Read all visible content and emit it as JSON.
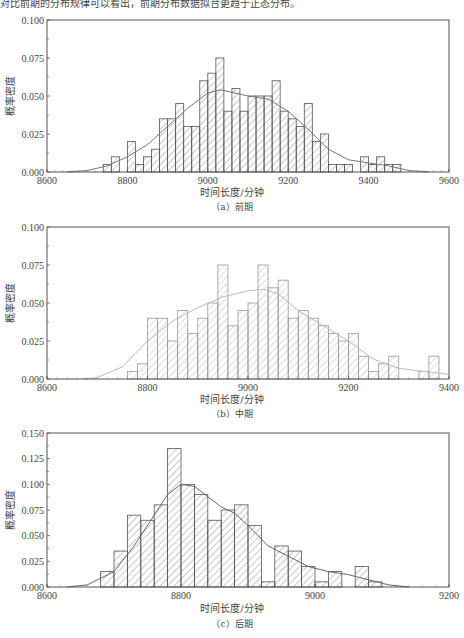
{
  "header_fragment": "对比前期的分布规律可以看出，前期分布数据拟合更趋于正态分布。",
  "chart_data": [
    {
      "id": "a",
      "type": "bar",
      "title": "",
      "caption": "（a）前期",
      "xlabel": "时间长度/分钟",
      "ylabel": "概率密度",
      "xlim": [
        8600,
        9600
      ],
      "ylim": [
        0,
        0.1
      ],
      "xticks": [
        8600,
        8800,
        9000,
        9200,
        9400,
        9600
      ],
      "yticks": [
        "0.000",
        "0.025",
        "0.050",
        "0.075",
        "0.100"
      ],
      "bin_width": 20,
      "bins_start": [
        8740,
        8760,
        8800,
        8820,
        8840,
        8860,
        8880,
        8900,
        8920,
        8940,
        8960,
        8980,
        9000,
        9020,
        9040,
        9060,
        9080,
        9100,
        9120,
        9140,
        9160,
        9180,
        9200,
        9220,
        9240,
        9260,
        9280,
        9300,
        9320,
        9340,
        9380,
        9400,
        9420,
        9440,
        9460
      ],
      "values": [
        0.005,
        0.01,
        0.02,
        0.005,
        0.01,
        0.015,
        0.035,
        0.035,
        0.045,
        0.03,
        0.03,
        0.06,
        0.065,
        0.075,
        0.04,
        0.055,
        0.04,
        0.05,
        0.05,
        0.05,
        0.06,
        0.04,
        0.035,
        0.03,
        0.045,
        0.02,
        0.025,
        0.005,
        0.005,
        0.005,
        0.01,
        0.005,
        0.01,
        0.005,
        0.005
      ],
      "curve": {
        "type": "kde",
        "x": [
          8650,
          8700,
          8750,
          8800,
          8850,
          8900,
          8950,
          9000,
          9030,
          9050,
          9100,
          9150,
          9200,
          9250,
          9300,
          9350,
          9400,
          9450,
          9500,
          9550
        ],
        "y": [
          0.0,
          0.001,
          0.004,
          0.01,
          0.018,
          0.03,
          0.042,
          0.052,
          0.054,
          0.053,
          0.05,
          0.048,
          0.04,
          0.028,
          0.015,
          0.008,
          0.006,
          0.004,
          0.001,
          0.0
        ]
      },
      "grid": false
    },
    {
      "id": "b",
      "type": "bar",
      "title": "",
      "caption": "（b）中期",
      "xlabel": "时间长度/分钟",
      "ylabel": "概率密度",
      "xlim": [
        8600,
        9400
      ],
      "ylim": [
        0,
        0.1
      ],
      "xticks": [
        8600,
        8800,
        9000,
        9200,
        9400
      ],
      "yticks": [
        "0.000",
        "0.025",
        "0.050",
        "0.075",
        "0.100"
      ],
      "bin_width": 20,
      "bins_start": [
        8760,
        8780,
        8800,
        8820,
        8840,
        8860,
        8880,
        8900,
        8920,
        8940,
        8960,
        8980,
        9000,
        9020,
        9040,
        9060,
        9080,
        9100,
        9120,
        9140,
        9160,
        9180,
        9200,
        9220,
        9240,
        9260,
        9280,
        9340,
        9360
      ],
      "values": [
        0.005,
        0.01,
        0.04,
        0.04,
        0.025,
        0.045,
        0.03,
        0.04,
        0.05,
        0.075,
        0.035,
        0.045,
        0.05,
        0.075,
        0.06,
        0.065,
        0.04,
        0.045,
        0.04,
        0.035,
        0.03,
        0.025,
        0.03,
        0.015,
        0.005,
        0.01,
        0.015,
        0.005,
        0.015
      ],
      "curve": {
        "type": "kde",
        "x": [
          8670,
          8700,
          8750,
          8800,
          8850,
          8900,
          8950,
          9000,
          9030,
          9060,
          9100,
          9150,
          9200,
          9250,
          9300,
          9350,
          9400
        ],
        "y": [
          0.0,
          0.001,
          0.008,
          0.025,
          0.038,
          0.047,
          0.054,
          0.058,
          0.059,
          0.056,
          0.045,
          0.035,
          0.025,
          0.013,
          0.007,
          0.005,
          0.003
        ]
      },
      "grid": false
    },
    {
      "id": "c",
      "type": "bar",
      "title": "",
      "caption": "（c）后期",
      "xlabel": "时间长度/分钟",
      "ylabel": "概率密度",
      "xlim": [
        8600,
        9200
      ],
      "ylim": [
        0,
        0.15
      ],
      "xticks": [
        8600,
        8800,
        9000,
        9200
      ],
      "yticks": [
        "0.000",
        "0.025",
        "0.050",
        "0.075",
        "0.100",
        "0.125",
        "0.150"
      ],
      "bin_width": 20,
      "bins_start": [
        8680,
        8700,
        8720,
        8740,
        8760,
        8780,
        8800,
        8820,
        8840,
        8860,
        8880,
        8900,
        8920,
        8940,
        8960,
        8980,
        9000,
        9020,
        9060,
        9080
      ],
      "values": [
        0.015,
        0.035,
        0.07,
        0.065,
        0.08,
        0.135,
        0.1,
        0.09,
        0.065,
        0.075,
        0.08,
        0.06,
        0.005,
        0.04,
        0.035,
        0.02,
        0.005,
        0.015,
        0.02,
        0.005
      ],
      "curve": {
        "type": "kde",
        "x": [
          8630,
          8660,
          8700,
          8730,
          8760,
          8780,
          8800,
          8820,
          8840,
          8860,
          8880,
          8900,
          8930,
          8960,
          8990,
          9020,
          9050,
          9080,
          9110,
          9140
        ],
        "y": [
          0.0,
          0.002,
          0.015,
          0.04,
          0.07,
          0.09,
          0.1,
          0.098,
          0.088,
          0.078,
          0.072,
          0.06,
          0.04,
          0.03,
          0.02,
          0.015,
          0.012,
          0.007,
          0.002,
          0.0
        ]
      },
      "grid": false
    }
  ]
}
